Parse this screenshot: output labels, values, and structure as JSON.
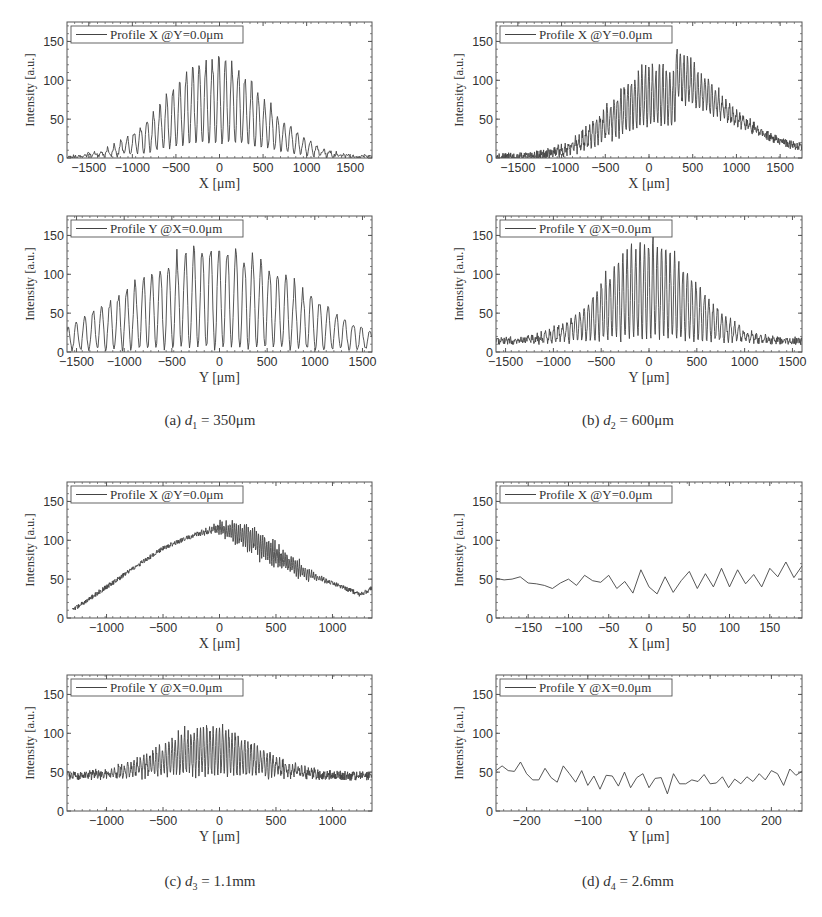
{
  "figure": {
    "captions": [
      {
        "id": "a",
        "label": "(a)",
        "var": "d",
        "sub": "1",
        "eq": " = 350μm"
      },
      {
        "id": "b",
        "label": "(b)",
        "var": "d",
        "sub": "2",
        "eq": " = 600μm"
      },
      {
        "id": "c",
        "label": "(c)",
        "var": "d",
        "sub": "3",
        "eq": " = 1.1mm"
      },
      {
        "id": "d",
        "label": "(d)",
        "var": "d",
        "sub": "4",
        "eq": " = 2.6mm"
      }
    ]
  },
  "chart_data": [
    {
      "panel": "a",
      "subplot": "top",
      "type": "line",
      "legend": "Profile X @Y=0.0μm",
      "xlabel": "X [μm]",
      "ylabel": "Intensity [a.u.]",
      "xlim": [
        -1750,
        1750
      ],
      "ylim": [
        0,
        175
      ],
      "xticks": [
        -1500,
        -1000,
        -500,
        0,
        500,
        1000,
        1500
      ],
      "yticks": [
        0,
        50,
        100,
        150
      ],
      "description": "Interference fringes under Gaussian envelope, peak ~115 near X=-80, fringe period ~75μm, fringe minima ~10-20",
      "model": {
        "peak": 112,
        "center": -50,
        "sigma": 560,
        "period": 75,
        "contrast": 0.85,
        "noise": 3,
        "floor": 1,
        "phase": 0.6
      }
    },
    {
      "panel": "a",
      "subplot": "bottom",
      "type": "line",
      "legend": "Profile Y @X=0.0μm",
      "xlabel": "Y [μm]",
      "ylabel": "Intensity [a.u.]",
      "xlim": [
        -1600,
        1600
      ],
      "ylim": [
        0,
        175
      ],
      "xticks": [
        -1500,
        -1000,
        -500,
        0,
        500,
        1000,
        1500
      ],
      "yticks": [
        0,
        50,
        100,
        150
      ],
      "description": "High-contrast fringes, peak ~135 near Y=-80, fringe period ~88μm, broad envelope still ~50 at Y=1600",
      "model": {
        "peak": 130,
        "center": -50,
        "sigma": 900,
        "period": 88,
        "contrast": 0.98,
        "noise": 3,
        "floor": 2,
        "phase": 0.4
      }
    },
    {
      "panel": "b",
      "subplot": "top",
      "type": "line",
      "legend": "Profile X @Y=0.0μm",
      "xlabel": "X [μm]",
      "ylabel": "Intensity [a.u.]",
      "xlim": [
        -1750,
        1750
      ],
      "ylim": [
        0,
        175
      ],
      "xticks": [
        -1500,
        -1000,
        -500,
        0,
        500,
        1000,
        1500
      ],
      "yticks": [
        0,
        50,
        100,
        150
      ],
      "description": "Dense fringes, peak ~130 near X=150, fringe period ~40μm, tail ~45 at X=1000 decreasing to ~5 at X=1750",
      "model": {
        "peak": 85,
        "center": 80,
        "sigma": 520,
        "period": 40,
        "contrast": 0.7,
        "noise": 6,
        "floor": 0,
        "phase": 0.2,
        "tail": {
          "amp": 45,
          "center": 500,
          "sigma": 800
        }
      }
    },
    {
      "panel": "b",
      "subplot": "bottom",
      "type": "line",
      "legend": "Profile Y @X=0.0μm",
      "xlabel": "Y [μm]",
      "ylabel": "Intensity [a.u.]",
      "xlim": [
        -1600,
        1600
      ],
      "ylim": [
        0,
        175
      ],
      "xticks": [
        -1500,
        -1000,
        -500,
        0,
        500,
        1000,
        1500
      ],
      "yticks": [
        0,
        50,
        100,
        150
      ],
      "description": "High-contrast dense fringes, peak ~130 near Y=-80, fringe period ~45μm, noisy tail ~15-30 beyond Y=900",
      "model": {
        "peak": 122,
        "center": 0,
        "sigma": 480,
        "period": 45,
        "contrast": 0.97,
        "noise": 5,
        "floor": 14,
        "phase": 0.5
      }
    },
    {
      "panel": "c",
      "subplot": "top",
      "type": "line",
      "legend": "Profile X @Y=0.0μm",
      "xlabel": "X [μm]",
      "ylabel": "Intensity [a.u.]",
      "xlim": [
        -1350,
        1350
      ],
      "ylim": [
        0,
        175
      ],
      "xticks": [
        -1000,
        -500,
        0,
        500,
        1000
      ],
      "yticks": [
        0,
        50,
        100,
        150
      ],
      "description": "Smooth triangular-ish envelope rising from ~10 at X=-1300 to ~115 at X=0, then noisy fine fringes decaying to ~35 at X=1350",
      "model": {
        "shape": "ramp",
        "points": [
          [
            -1300,
            10
          ],
          [
            -1000,
            40
          ],
          [
            -500,
            90
          ],
          [
            -200,
            108
          ],
          [
            0,
            115
          ],
          [
            250,
            105
          ],
          [
            500,
            80
          ],
          [
            800,
            55
          ],
          [
            1000,
            45
          ],
          [
            1250,
            30
          ],
          [
            1350,
            38
          ]
        ],
        "fringe_from": -200,
        "fringe_to": 950,
        "period": 18,
        "amp": 14,
        "noise": 3
      }
    },
    {
      "panel": "c",
      "subplot": "bottom",
      "type": "line",
      "legend": "Profile Y @X=0.0μm",
      "xlabel": "Y [μm]",
      "ylabel": "Intensity [a.u.]",
      "xlim": [
        -1350,
        1350
      ],
      "ylim": [
        0,
        175
      ],
      "xticks": [
        -1000,
        -500,
        0,
        500,
        1000
      ],
      "yticks": [
        0,
        50,
        100,
        150
      ],
      "description": "Baseline ~45 for |Y|>900, dense fringes between -900 and 600 with maxima up to ~120 and minima near 0",
      "model": {
        "peak": 60,
        "center": -100,
        "sigma": 420,
        "period": 28,
        "contrast": 0.95,
        "noise": 6,
        "floor": 45,
        "phase": 0.1
      }
    },
    {
      "panel": "d",
      "subplot": "top",
      "type": "line",
      "legend": "Profile X @Y=0.0μm",
      "xlabel": "X [μm]",
      "ylabel": "Intensity [a.u.]",
      "xlim": [
        -190,
        190
      ],
      "ylim": [
        0,
        175
      ],
      "xticks": [
        -150,
        -100,
        -50,
        0,
        50,
        100,
        150
      ],
      "yticks": [
        0,
        50,
        100,
        150
      ],
      "x": [
        -190,
        -180,
        -170,
        -160,
        -150,
        -140,
        -130,
        -120,
        -110,
        -100,
        -90,
        -80,
        -70,
        -60,
        -50,
        -40,
        -30,
        -20,
        -10,
        0,
        10,
        20,
        30,
        40,
        50,
        60,
        70,
        80,
        90,
        100,
        110,
        120,
        130,
        140,
        150,
        160,
        170,
        180,
        190
      ],
      "values": [
        51,
        49,
        50,
        53,
        45,
        44,
        42,
        38,
        45,
        50,
        42,
        55,
        48,
        46,
        55,
        38,
        47,
        32,
        62,
        40,
        31,
        53,
        33,
        48,
        60,
        38,
        57,
        40,
        64,
        40,
        62,
        44,
        56,
        40,
        64,
        53,
        72,
        52,
        67
      ]
    },
    {
      "panel": "d",
      "subplot": "bottom",
      "type": "line",
      "legend": "Profile Y @X=0.0μm",
      "xlabel": "Y [μm]",
      "ylabel": "Intensity [a.u.]",
      "xlim": [
        -250,
        250
      ],
      "ylim": [
        0,
        175
      ],
      "xticks": [
        -200,
        -100,
        0,
        100,
        200
      ],
      "yticks": [
        0,
        50,
        100,
        150
      ],
      "x": [
        -250,
        -240,
        -230,
        -220,
        -210,
        -200,
        -190,
        -180,
        -170,
        -160,
        -150,
        -140,
        -130,
        -120,
        -110,
        -100,
        -90,
        -80,
        -70,
        -60,
        -50,
        -40,
        -30,
        -20,
        -10,
        0,
        10,
        20,
        30,
        40,
        50,
        60,
        70,
        80,
        90,
        100,
        110,
        120,
        130,
        140,
        150,
        160,
        170,
        180,
        190,
        200,
        210,
        220,
        230,
        240,
        250
      ],
      "values": [
        52,
        58,
        52,
        51,
        63,
        48,
        40,
        40,
        55,
        43,
        37,
        58,
        48,
        37,
        52,
        33,
        45,
        28,
        46,
        45,
        32,
        50,
        30,
        43,
        48,
        30,
        42,
        43,
        22,
        48,
        35,
        35,
        40,
        38,
        47,
        35,
        36,
        44,
        30,
        41,
        35,
        44,
        38,
        48,
        40,
        52,
        48,
        33,
        54,
        46,
        51
      ]
    }
  ]
}
